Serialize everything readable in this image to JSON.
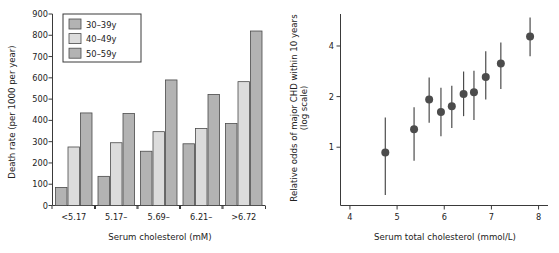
{
  "figure": {
    "background": "#ffffff",
    "panels": [
      "left-bar-chart",
      "right-scatter-chart"
    ]
  },
  "chart_data": [
    {
      "id": "death-rate-by-cholesterol",
      "type": "bar",
      "title": "",
      "xlabel": "Serum cholesterol (mM)",
      "ylabel": "Death rate (per 1000 per year)",
      "categories": [
        "<5.17",
        "5.17–",
        "5.69–",
        "6.21–",
        ">6.72"
      ],
      "series": [
        {
          "name": "30–39y",
          "color": "#b3b3b3",
          "values": [
            85,
            137,
            255,
            290,
            385
          ]
        },
        {
          "name": "40–49y",
          "color": "#dcdcdc",
          "values": [
            275,
            295,
            347,
            362,
            582
          ]
        },
        {
          "name": "50–59y",
          "color": "#b3b3b3",
          "values": [
            435,
            432,
            590,
            522,
            820
          ]
        }
      ],
      "ylim": [
        0,
        900
      ],
      "yticks": [
        0,
        100,
        200,
        300,
        400,
        500,
        600,
        700,
        800,
        900
      ],
      "ytick_labels": [
        "0",
        "100",
        "200",
        "300",
        "400",
        "500",
        "600",
        "700",
        "800",
        "900"
      ],
      "grid": false,
      "legend_position": "top-left",
      "legend_entries": [
        "30–39y",
        "40–49y",
        "50–59y"
      ]
    },
    {
      "id": "relative-odds-chd",
      "type": "scatter",
      "title": "",
      "xlabel": "Serum total cholesterol (mmol/L)",
      "ylabel": "Relative odds of major CHD within 10 years (log scale)",
      "ylabel_line1": "Relative odds of major CHD within 10 years",
      "ylabel_line2": "(log scale)",
      "xlim": [
        3.8,
        8.2
      ],
      "xticks": [
        4,
        5,
        6,
        7,
        8
      ],
      "xtick_labels": [
        "4",
        "5",
        "6",
        "7",
        "8"
      ],
      "ylim_log": [
        0.45,
        6.2
      ],
      "yticks": [
        1,
        2,
        4
      ],
      "ytick_labels": [
        "1",
        "2",
        "4"
      ],
      "yscale": "log",
      "grid": false,
      "points": [
        {
          "x": 4.75,
          "y": 0.93,
          "lo": 0.52,
          "hi": 1.5
        },
        {
          "x": 5.36,
          "y": 1.28,
          "lo": 0.83,
          "hi": 1.73
        },
        {
          "x": 5.68,
          "y": 1.92,
          "lo": 1.4,
          "hi": 2.6
        },
        {
          "x": 5.93,
          "y": 1.62,
          "lo": 1.16,
          "hi": 2.26
        },
        {
          "x": 6.16,
          "y": 1.75,
          "lo": 1.3,
          "hi": 2.32
        },
        {
          "x": 6.41,
          "y": 2.07,
          "lo": 1.53,
          "hi": 2.82
        },
        {
          "x": 6.63,
          "y": 2.12,
          "lo": 1.45,
          "hi": 2.85
        },
        {
          "x": 6.88,
          "y": 2.62,
          "lo": 1.92,
          "hi": 3.72
        },
        {
          "x": 7.2,
          "y": 3.15,
          "lo": 2.22,
          "hi": 4.2
        },
        {
          "x": 7.82,
          "y": 4.55,
          "lo": 3.48,
          "hi": 5.9
        }
      ],
      "marker": "filled-circle",
      "marker_color": "#4c4c4c",
      "errorbar_color": "#4c4c4c"
    }
  ]
}
